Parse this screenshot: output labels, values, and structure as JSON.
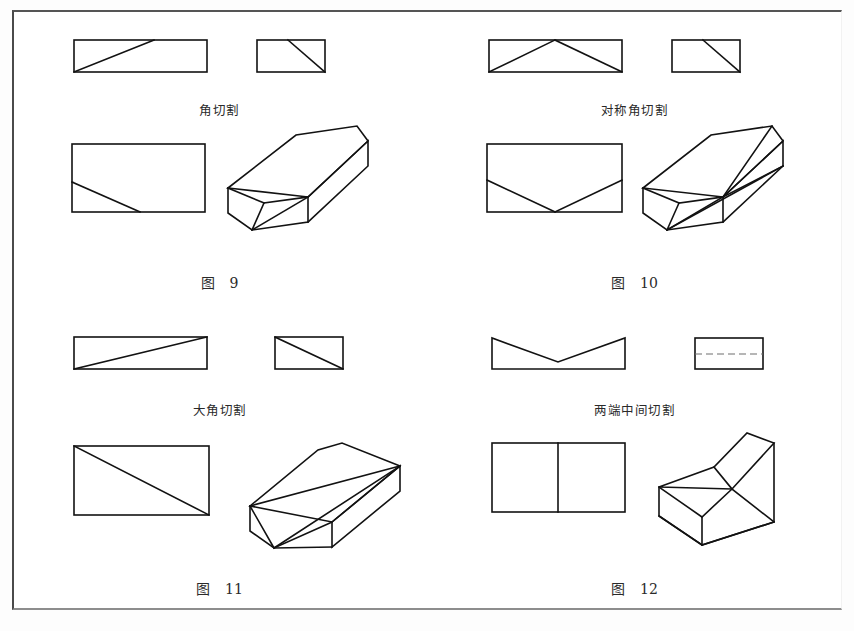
{
  "page": {
    "background_color": "#ffffff",
    "line_color": "#121212",
    "frame_color": "#4a4a4a"
  },
  "figures": [
    {
      "id": "fig9",
      "cut_label": "角切割",
      "caption_word": "图",
      "caption_number": "9",
      "views": [
        "front-elevation",
        "side-elevation",
        "plan",
        "isometric"
      ],
      "description": "corner cut"
    },
    {
      "id": "fig10",
      "cut_label": "对称角切割",
      "caption_word": "图",
      "caption_number": "10",
      "views": [
        "front-elevation",
        "side-elevation",
        "plan",
        "isometric"
      ],
      "description": "symmetric corner cut"
    },
    {
      "id": "fig11",
      "cut_label": "大角切割",
      "caption_word": "图",
      "caption_number": "11",
      "views": [
        "front-elevation",
        "side-elevation",
        "plan",
        "isometric"
      ],
      "description": "large corner cut"
    },
    {
      "id": "fig12",
      "cut_label": "两端中间切割",
      "caption_word": "图",
      "caption_number": "12",
      "views": [
        "front-elevation",
        "side-elevation",
        "plan",
        "isometric"
      ],
      "description": "both ends middle cut"
    }
  ]
}
